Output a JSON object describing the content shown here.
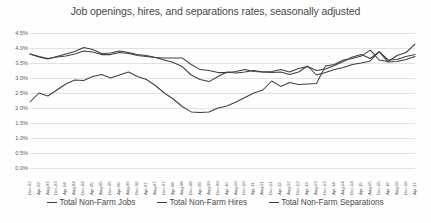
{
  "chart_data": {
    "type": "line",
    "title": "Job openings, hires, and separations rates, seasonally adjusted",
    "xlabel": "",
    "ylabel": "",
    "ylim": [
      0.0,
      4.5
    ],
    "ytick_values": [
      4.5,
      4.0,
      3.5,
      3.0,
      2.5,
      2.0,
      1.5,
      1.0,
      0.5,
      0.0
    ],
    "ytick_labels": [
      "4.5%",
      "4.0%",
      "3.5%",
      "3.0%",
      "2.5%",
      "2.0%",
      "1.5%",
      "1.0%",
      "0.5%",
      "0.0%"
    ],
    "grid": true,
    "legend_position": "bottom",
    "line_color": "#3f3f3f",
    "grid_color": "#e2e2e2",
    "categories": [
      "Dec-02",
      "Apr-03",
      "Aug-03",
      "Dec-03",
      "Apr-04",
      "Aug-04",
      "Dec-04",
      "Apr-05",
      "Aug-05",
      "Dec-05",
      "Apr-06",
      "Aug-06",
      "Dec-06",
      "Apr-07",
      "Aug-07",
      "Dec-07",
      "Apr-08",
      "Aug-08",
      "Dec-08",
      "Apr-09",
      "Aug-09",
      "Dec-09",
      "Apr-10",
      "Aug-10",
      "Dec-10",
      "Apr-11",
      "Aug-11",
      "Dec-11",
      "Apr-12",
      "Aug-12",
      "Dec-12",
      "Apr-13",
      "Aug-13",
      "Dec-13",
      "Apr-14",
      "Aug-14",
      "Dec-14",
      "Apr-15",
      "Aug-15",
      "Dec-15",
      "Apr-16",
      "Aug-16",
      "Dec-16",
      "Apr-17"
    ],
    "series": [
      {
        "name": "Total Non-Farm Jobs",
        "values": [
          2.2,
          2.5,
          2.4,
          2.6,
          2.8,
          2.93,
          2.92,
          3.05,
          3.12,
          3.0,
          3.1,
          3.2,
          3.05,
          2.95,
          2.75,
          2.5,
          2.3,
          2.05,
          1.87,
          1.85,
          1.87,
          2.0,
          2.07,
          2.2,
          2.35,
          2.5,
          2.6,
          2.9,
          2.72,
          2.85,
          2.78,
          2.8,
          2.82,
          3.4,
          3.45,
          3.6,
          3.65,
          3.73,
          3.93,
          3.6,
          3.55,
          3.75,
          3.85,
          4.13
        ]
      },
      {
        "name": "Total Non-Farm Hires",
        "values": [
          3.8,
          3.7,
          3.63,
          3.72,
          3.8,
          3.88,
          4.02,
          3.95,
          3.82,
          3.83,
          3.9,
          3.85,
          3.78,
          3.75,
          3.68,
          3.6,
          3.52,
          3.38,
          3.1,
          2.95,
          2.88,
          3.05,
          3.2,
          3.17,
          3.2,
          3.25,
          3.2,
          3.22,
          3.28,
          3.2,
          3.32,
          3.38,
          3.25,
          3.3,
          3.42,
          3.55,
          3.7,
          3.78,
          3.65,
          3.88,
          3.6,
          3.62,
          3.72,
          3.78
        ]
      },
      {
        "name": "Total Non-Farm Separations",
        "values": [
          3.8,
          3.72,
          3.65,
          3.7,
          3.73,
          3.8,
          3.9,
          3.87,
          3.78,
          3.78,
          3.85,
          3.82,
          3.75,
          3.72,
          3.68,
          3.67,
          3.67,
          3.67,
          3.45,
          3.28,
          3.25,
          3.18,
          3.18,
          3.22,
          3.28,
          3.22,
          3.2,
          3.18,
          3.2,
          3.12,
          3.2,
          3.4,
          3.1,
          3.18,
          3.28,
          3.35,
          3.45,
          3.5,
          3.57,
          3.88,
          3.53,
          3.55,
          3.62,
          3.72
        ]
      }
    ]
  },
  "legend": [
    {
      "label": "Total Non-Farm Jobs"
    },
    {
      "label": "Total Non-Farm Hires"
    },
    {
      "label": "Total Non-Farm Separations"
    }
  ]
}
